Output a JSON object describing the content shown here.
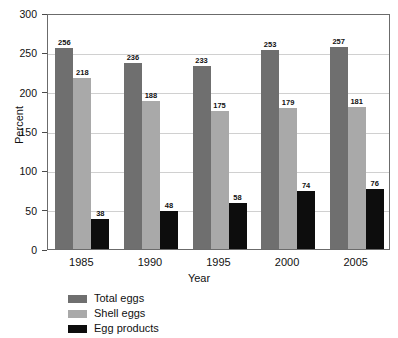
{
  "chart_data": {
    "type": "bar",
    "title": "",
    "xlabel": "Year",
    "ylabel": "Percent",
    "categories": [
      "1985",
      "1990",
      "1995",
      "2000",
      "2005"
    ],
    "series": [
      {
        "name": "Total eggs",
        "color": "#6f6f6f",
        "values": [
          256,
          236,
          233,
          253,
          257
        ]
      },
      {
        "name": "Shell eggs",
        "color": "#a9a9a9",
        "values": [
          218,
          188,
          175,
          179,
          181
        ]
      },
      {
        "name": "Egg products",
        "color": "#0d0d0d",
        "values": [
          38,
          48,
          58,
          74,
          76
        ]
      }
    ],
    "ylim": [
      0,
      300
    ],
    "yticks": [
      0,
      50,
      100,
      150,
      200,
      250,
      300
    ],
    "ytick_labels": [
      "0",
      "50",
      "100",
      "150",
      "200",
      "250",
      "300"
    ],
    "grid": true,
    "legend_position": "below-left"
  },
  "axes": {
    "y_title": "Percent",
    "x_title": "Year"
  },
  "legend": {
    "items": [
      {
        "label": "Total eggs",
        "swatch": "total"
      },
      {
        "label": "Shell eggs",
        "swatch": "shell"
      },
      {
        "label": "Egg products",
        "swatch": "prods"
      }
    ]
  },
  "colors": {
    "total_eggs": "#6f6f6f",
    "shell_eggs": "#a9a9a9",
    "egg_products": "#0d0d0d",
    "gridline": "#d0d0d0",
    "frame": "#6b6b6b",
    "background": "#ffffff"
  }
}
